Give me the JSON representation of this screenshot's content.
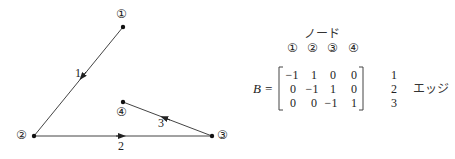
{
  "graph": {
    "nodes": [
      {
        "id": 1,
        "label": "①",
        "x": 123,
        "y": 27,
        "label_x": 123,
        "label_y": 15
      },
      {
        "id": 2,
        "label": "②",
        "x": 34,
        "y": 136,
        "label_x": 23,
        "label_y": 136
      },
      {
        "id": 3,
        "label": "③",
        "x": 212,
        "y": 136,
        "label_x": 224,
        "label_y": 136
      },
      {
        "id": 4,
        "label": "④",
        "x": 123,
        "y": 102,
        "label_x": 123,
        "label_y": 113
      }
    ],
    "edges": [
      {
        "id": 1,
        "label": "1",
        "from": 1,
        "to": 2
      },
      {
        "id": 2,
        "label": "2",
        "from": 2,
        "to": 3
      },
      {
        "id": 3,
        "label": "3",
        "from": 3,
        "to": 4
      }
    ]
  },
  "matrix": {
    "node_header": "ノード",
    "node_labels": [
      "①",
      "②",
      "③",
      "④"
    ],
    "lhs": "B =",
    "rows": [
      [
        "−1",
        "1",
        "0",
        "0"
      ],
      [
        "0",
        "−1",
        "1",
        "0"
      ],
      [
        "0",
        "0",
        "−1",
        "1"
      ]
    ],
    "edge_labels": [
      "1",
      "2",
      "3"
    ],
    "edge_header": "エッジ"
  },
  "colors": {
    "line": "#333333",
    "text": "#222222"
  }
}
